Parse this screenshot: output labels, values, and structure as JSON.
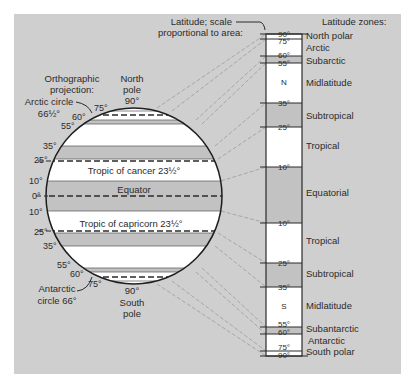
{
  "title_left": {
    "line1": "Orthographic",
    "line2": "projection:"
  },
  "title_scale": {
    "line1": "Latitude; scale",
    "line2": "proportional to area:"
  },
  "title_zones": "Latitude zones:",
  "north_pole": {
    "line1": "North",
    "line2": "pole",
    "line3": "90°"
  },
  "south_pole": {
    "line1": "90°",
    "line2": "South",
    "line3": "pole"
  },
  "arctic_circle": {
    "line1": "Arctic circle",
    "line2": "66½°"
  },
  "antarctic_circle": {
    "line1": "Antarctic",
    "line2": "circle 66°"
  },
  "globe_labels": {
    "tropic_cancer": "Tropic of cancer 23½°",
    "equator": "Equator",
    "tropic_capricorn": "Tropic of capricorn 23½°"
  },
  "globe_ticks_north": [
    "75°",
    "60°",
    "55°",
    "35°",
    "25°",
    "10°",
    "0°"
  ],
  "globe_ticks_south": [
    "10°",
    "25°",
    "35°",
    "55°",
    "60°",
    "75°"
  ],
  "scale_ticks": [
    "90°",
    "75°",
    "60°",
    "55°",
    "35°",
    "25°",
    "10°",
    "10°",
    "25°",
    "35°",
    "55°",
    "60°",
    "75°",
    "90°"
  ],
  "scale_hemisphere": {
    "north": "N",
    "south": "S"
  },
  "zones": [
    "North polar",
    "Arctic",
    "Subarctic",
    "Midlatitude",
    "Subtropical",
    "Tropical",
    "Equatorial",
    "Tropical",
    "Subtropical",
    "Midlatitude",
    "Subantarctic",
    "Antarctic",
    "South polar"
  ],
  "colors": {
    "panel": "#cfcfcf",
    "band_gray": "#c2c2c2",
    "band_white": "#ffffff",
    "ink": "#2b2b2b",
    "connector": "#9a9a9a"
  }
}
